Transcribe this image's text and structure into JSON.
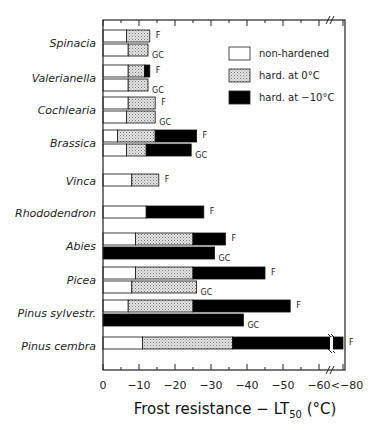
{
  "chart_data": {
    "type": "bar",
    "orientation": "horizontal-stacked",
    "xlabel": "Frost resistance − LT50 (°C)",
    "xlabel_main": "Frost resistance − LT",
    "xlabel_sub": "50",
    "xlabel_unit": "(°C)",
    "x_ticks": [
      "0",
      "−10",
      "−20",
      "−30",
      "−40",
      "−50",
      "−60",
      "<−80"
    ],
    "x_tick_values": [
      0,
      -10,
      -20,
      -30,
      -40,
      -50,
      -60,
      -80
    ],
    "xlim": [
      0,
      -66
    ],
    "axis_break": "between −60 and −80",
    "legend": {
      "position": "upper right inside",
      "entries": [
        {
          "name": "non-hardened",
          "color": "#ffffff"
        },
        {
          "name": "hard. at 0°C",
          "color": "#c8c8c8",
          "pattern": "stipple"
        },
        {
          "name": "hard. at −10°C",
          "color": "#000000"
        }
      ]
    },
    "bar_suffix_labels": {
      "F": "F",
      "GC": "GC"
    },
    "categories": [
      "Spinacia",
      "Valerianella",
      "Cochlearia",
      "Brassica",
      "Vinca",
      "Rhododendron",
      "Abies",
      "Picea",
      "Pinus sylvestr.",
      "Pinus cembra"
    ],
    "series": [
      {
        "species": "Spinacia",
        "bars": [
          {
            "label": "F",
            "non_hardened": -6.5,
            "hard_0": -13,
            "hard_m10": null
          },
          {
            "label": "GC",
            "non_hardened": -7,
            "hard_0": -12.5,
            "hard_m10": null
          }
        ]
      },
      {
        "species": "Valerianella",
        "bars": [
          {
            "label": "F",
            "non_hardened": -7,
            "hard_0": -11.5,
            "hard_m10": -13
          },
          {
            "label": "GC",
            "non_hardened": -7,
            "hard_0": -12.5,
            "hard_m10": null
          }
        ]
      },
      {
        "species": "Cochlearia",
        "bars": [
          {
            "label": "F",
            "non_hardened": -7,
            "hard_0": -14.5,
            "hard_m10": null
          },
          {
            "label": "GC",
            "non_hardened": -6.5,
            "hard_0": -14.5,
            "hard_m10": null
          }
        ]
      },
      {
        "species": "Brassica",
        "bars": [
          {
            "label": "F",
            "non_hardened": -4,
            "hard_0": -14.5,
            "hard_m10": -26
          },
          {
            "label": "GC",
            "non_hardened": -6.5,
            "hard_0": -12,
            "hard_m10": -24.5
          }
        ]
      },
      {
        "species": "Vinca",
        "bars": [
          {
            "label": "F",
            "non_hardened": -8,
            "hard_0": -15.5,
            "hard_m10": null
          }
        ]
      },
      {
        "species": "Rhododendron",
        "bars": [
          {
            "label": "F",
            "non_hardened": -12,
            "hard_0": null,
            "hard_m10": -28
          }
        ]
      },
      {
        "species": "Abies",
        "bars": [
          {
            "label": "F",
            "non_hardened": -9,
            "hard_0": -25,
            "hard_m10": -34
          },
          {
            "label": "GC",
            "non_hardened": null,
            "hard_0": null,
            "hard_m10": -31
          }
        ]
      },
      {
        "species": "Picea",
        "bars": [
          {
            "label": "F",
            "non_hardened": -9,
            "hard_0": -25,
            "hard_m10": -45
          },
          {
            "label": "GC",
            "non_hardened": -8,
            "hard_0": -26,
            "hard_m10": null
          }
        ]
      },
      {
        "species": "Pinus sylvestr.",
        "bars": [
          {
            "label": "F",
            "non_hardened": -7,
            "hard_0": -25,
            "hard_m10": -52
          },
          {
            "label": "GC",
            "non_hardened": null,
            "hard_0": null,
            "hard_m10": -39
          }
        ]
      },
      {
        "species": "Pinus cembra",
        "bars": [
          {
            "label": "F",
            "non_hardened": -11,
            "hard_0": -36,
            "hard_m10": -80
          }
        ]
      }
    ]
  }
}
